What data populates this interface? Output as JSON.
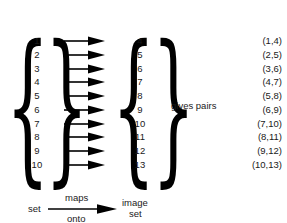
{
  "diagram": {
    "title": "set maps onto image set",
    "domain_set": {
      "open_delimiter": "{",
      "close_delimiter": "}",
      "elements": [
        "1",
        "2",
        "3",
        "4",
        "5",
        "6",
        "7",
        "8",
        "9",
        "10"
      ]
    },
    "image_set": {
      "open_delimiter": "{",
      "close_delimiter": "}",
      "elements": [
        "4",
        "5",
        "6",
        "7",
        "8",
        "9",
        "10",
        "11",
        "12",
        "13"
      ]
    },
    "arrows": {
      "count": 10,
      "icon": "right-arrow-icon",
      "description": "maps-to arrow"
    },
    "gives_pairs_label": "gives pairs",
    "pairs": [
      "(1,4)",
      "(2,5)",
      "(3,6)",
      "(4,7)",
      "(5,8)",
      "(6,9)",
      "(7,10)",
      "(8,11)",
      "(9,12)",
      "(10,13)"
    ],
    "legend": {
      "source_label": "set",
      "relation_above": "maps",
      "relation_below": "onto",
      "target_label_line1": "image",
      "target_label_line2": "set",
      "arrow_icon": "right-arrow-icon"
    },
    "colors": {
      "ink": "#1a1a1a",
      "stroke": "#000000",
      "background": "#ffffff"
    }
  }
}
